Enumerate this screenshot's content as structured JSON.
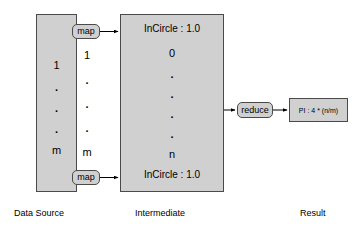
{
  "diagram": {
    "colors": {
      "box_fill": "#d0d0d0",
      "box_stroke": "#4a4a4a",
      "connector": "#000000",
      "background": "#ffffff"
    },
    "data_source": {
      "caption": "Data Source",
      "entries": [
        "1",
        ".",
        ".",
        ".",
        "m"
      ]
    },
    "map_stage": {
      "middle_entries": [
        "1",
        ".",
        ".",
        ".",
        "m"
      ],
      "top_label": "map",
      "bottom_label": "map"
    },
    "intermediate": {
      "caption": "Intermediate",
      "header": "InCircle : 1.0",
      "footer": "InCircle : 1.0",
      "entries": [
        "0",
        ".",
        ".",
        ".",
        ".",
        "n"
      ]
    },
    "reduce_stage": {
      "label": "reduce"
    },
    "result": {
      "caption": "Result",
      "value": "PI : 4 * (n/m)"
    }
  }
}
